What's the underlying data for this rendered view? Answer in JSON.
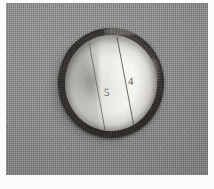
{
  "image": {
    "kind": "grayscale-photograph",
    "subject": "round sectioned specimen on woven fabric",
    "background_color": "#8a8a8a",
    "plate_border_color": "#fdfdfc"
  },
  "specimen": {
    "rim_color": "#3d3a36",
    "face_color": "#f2f0ea",
    "shadow_color": "#2a2724",
    "score_line_color": "#55524d",
    "segments": [
      {
        "label": "5"
      },
      {
        "label": "4"
      }
    ],
    "score_lines": [
      {
        "x1": 24,
        "y1": 7,
        "x2": 40,
        "y2": 95
      },
      {
        "x1": 52,
        "y1": 2,
        "x2": 70,
        "y2": 97
      }
    ]
  }
}
